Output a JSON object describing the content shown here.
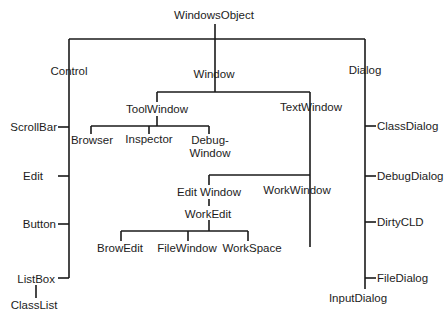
{
  "diagram": {
    "root": "WindowsObject",
    "nodes": {
      "windows_object": "WindowsObject",
      "control": "Control",
      "window": "Window",
      "dialog": "Dialog",
      "scroll_bar": "ScrollBar",
      "edit": "Edit",
      "button": "Button",
      "list_box": "ListBox",
      "class_list": "ClassList",
      "tool_window": "ToolWindow",
      "text_window": "TextWindow",
      "browser": "Browser",
      "inspector": "Inspector",
      "debug_window_line1": "Debug-",
      "debug_window_line2": "Window",
      "edit_window": "Edit Window",
      "work_window": "WorkWindow",
      "work_edit": "WorkEdit",
      "brow_edit": "BrowEdit",
      "file_window": "FileWindow",
      "work_space": "WorkSpace",
      "class_dialog": "ClassDialog",
      "debug_dialog": "DebugDialog",
      "dirty_cld": "DirtyCLD",
      "file_dialog": "FileDialog",
      "input_dialog": "InputDialog"
    },
    "edges": [
      [
        "WindowsObject",
        "Control"
      ],
      [
        "WindowsObject",
        "Window"
      ],
      [
        "WindowsObject",
        "Dialog"
      ],
      [
        "Control",
        "ScrollBar"
      ],
      [
        "Control",
        "Edit"
      ],
      [
        "Control",
        "Button"
      ],
      [
        "Control",
        "ListBox"
      ],
      [
        "ListBox",
        "ClassList"
      ],
      [
        "Window",
        "ToolWindow"
      ],
      [
        "Window",
        "TextWindow"
      ],
      [
        "ToolWindow",
        "Browser"
      ],
      [
        "ToolWindow",
        "Inspector"
      ],
      [
        "ToolWindow",
        "Debug-Window"
      ],
      [
        "TextWindow",
        "Edit Window"
      ],
      [
        "TextWindow",
        "WorkWindow"
      ],
      [
        "Edit Window",
        "WorkEdit"
      ],
      [
        "WorkEdit",
        "BrowEdit"
      ],
      [
        "WorkEdit",
        "FileWindow"
      ],
      [
        "WorkEdit",
        "WorkSpace"
      ],
      [
        "Dialog",
        "ClassDialog"
      ],
      [
        "Dialog",
        "DebugDialog"
      ],
      [
        "Dialog",
        "DirtyCLD"
      ],
      [
        "Dialog",
        "FileDialog"
      ],
      [
        "Dialog",
        "InputDialog"
      ]
    ],
    "line_color": "#1a1a1a",
    "text_color": "#1c1c1c",
    "background": "#ffffff"
  }
}
